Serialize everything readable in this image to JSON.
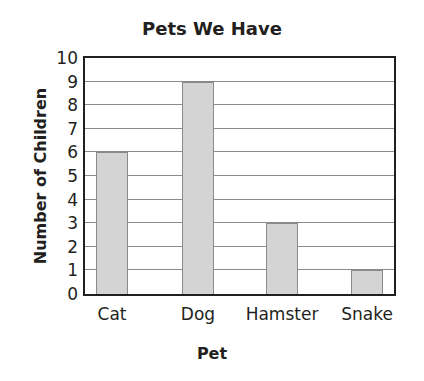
{
  "chart_data": {
    "type": "bar",
    "title": "Pets We Have",
    "xlabel": "Pet",
    "ylabel": "Number of Children",
    "categories": [
      "Cat",
      "Dog",
      "Hamster",
      "Snake"
    ],
    "values": [
      6,
      9,
      3,
      1
    ],
    "ylim": [
      0,
      10
    ],
    "yticks": [
      "0",
      "1",
      "2",
      "3",
      "4",
      "5",
      "6",
      "7",
      "8",
      "9",
      "10"
    ],
    "grid": true,
    "legend": null,
    "colors": {
      "bar_fill": "#d4d4d4",
      "bar_border": "#8a8a8a",
      "frame": "#231f20"
    }
  }
}
